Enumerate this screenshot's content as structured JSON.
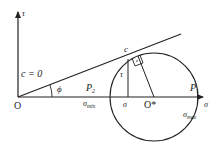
{
  "diagram": {
    "type": "mohr-coulomb-failure-circle",
    "axes": {
      "x_label": "σ",
      "y_label": "τ",
      "origin_label": "O"
    },
    "failure_line": {
      "cohesion_label": "c = 0",
      "angle_label": "ϕ"
    },
    "circle": {
      "center_label": "O*",
      "tangent_point_label": "c",
      "sigma_min_label": "σ",
      "sigma_min_sub": "min",
      "sigma_max_label": "σ",
      "sigma_max_sub": "max"
    },
    "stress_point": {
      "tau_label": "τ",
      "sigma_label": "σ"
    },
    "load_labels": {
      "p2_label": "P",
      "p2_sub": "2",
      "p1_label": "P",
      "p1_sub": "1"
    },
    "colors": {
      "line": "#222222",
      "background": "#ffffff"
    }
  }
}
